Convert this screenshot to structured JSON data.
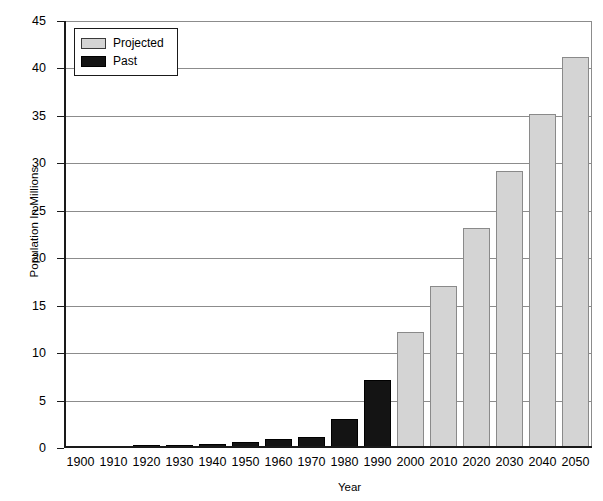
{
  "chart_data": {
    "type": "bar",
    "title": "",
    "xlabel": "Year",
    "ylabel": "Population In Millions",
    "categories": [
      "1900",
      "1910",
      "1920",
      "1930",
      "1940",
      "1950",
      "1960",
      "1970",
      "1980",
      "1990",
      "2000",
      "2010",
      "2020",
      "2030",
      "2040",
      "2050"
    ],
    "ylim": [
      0,
      45
    ],
    "yticks": [
      0,
      5,
      10,
      15,
      20,
      25,
      30,
      35,
      40,
      45
    ],
    "grid": true,
    "legend_position": "top-left",
    "series": [
      {
        "name": "Past",
        "color": "#141414",
        "values": [
          0.2,
          0.25,
          0.3,
          0.35,
          0.45,
          0.6,
          0.95,
          1.2,
          3.1,
          7.2,
          null,
          null,
          null,
          null,
          null,
          null
        ]
      },
      {
        "name": "Projected",
        "color": "#d4d4d4",
        "values": [
          null,
          null,
          null,
          null,
          null,
          null,
          null,
          null,
          null,
          null,
          12.2,
          17.1,
          23.2,
          29.2,
          35.2,
          41.2
        ]
      }
    ]
  },
  "axes": {
    "y_title": "Population In Millions",
    "x_title": "Year",
    "y_tick_labels": [
      "45",
      "40",
      "35",
      "30",
      "25",
      "20",
      "15",
      "10",
      "5",
      "0"
    ],
    "x_tick_labels": [
      "1900",
      "1910",
      "1920",
      "1930",
      "1940",
      "1950",
      "1960",
      "1970",
      "1980",
      "1990",
      "2000",
      "2010",
      "2020",
      "2030",
      "2040",
      "2050"
    ]
  },
  "legend": {
    "items": [
      {
        "label": "Projected",
        "swatch": "projected-swatch"
      },
      {
        "label": "Past",
        "swatch": "past-swatch"
      }
    ]
  }
}
